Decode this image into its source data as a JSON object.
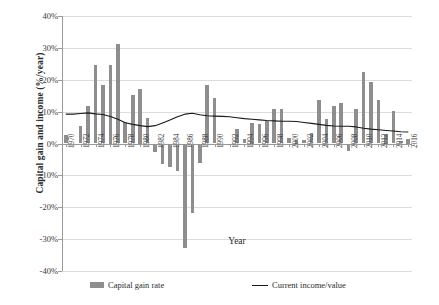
{
  "chart_data": {
    "type": "bar",
    "title": "",
    "xlabel": "Year",
    "ylabel": "Capital gain and income  (%/year)",
    "ylim": [
      -40,
      40
    ],
    "ytick_labels": [
      "40%",
      "30%",
      "20%",
      "10%",
      "0%",
      "-10%",
      "-20%",
      "-30%",
      "-40%"
    ],
    "ytick_values": [
      40,
      30,
      20,
      10,
      0,
      -10,
      -20,
      -30,
      -40
    ],
    "grid": true,
    "legend_position": "bottom",
    "categories": [
      "1970",
      "1971",
      "1972",
      "1973",
      "1974",
      "1975",
      "1976",
      "1977",
      "1978",
      "1979",
      "1980",
      "1981",
      "1982",
      "1983",
      "1984",
      "1985",
      "1986",
      "1987",
      "1988",
      "1989",
      "1990",
      "1991",
      "1992",
      "1993",
      "1994",
      "1995",
      "1996",
      "1997",
      "1998",
      "1999",
      "2000",
      "2001",
      "2002",
      "2003",
      "2004",
      "2005",
      "2006",
      "2007",
      "2008",
      "2009",
      "2010",
      "2011",
      "2012",
      "2013",
      "2014",
      "2015",
      "2016"
    ],
    "xtick_labels": [
      "1970",
      "",
      "1972",
      "",
      "1974",
      "",
      "1976",
      "",
      "1978",
      "",
      "1980",
      "",
      "1982",
      "",
      "1984",
      "",
      "1986",
      "",
      "1988",
      "",
      "1990",
      "",
      "1992",
      "",
      "1994",
      "",
      "1996",
      "",
      "1998",
      "",
      "2000",
      "",
      "2002",
      "",
      "2004",
      "",
      "2006",
      "",
      "2008",
      "",
      "2010",
      "",
      "2012",
      "",
      "2014",
      "",
      "2016"
    ],
    "series": [
      {
        "name": "Capital gain rate",
        "type": "bar",
        "color": "#8e8e8e",
        "values": [
          2.6,
          0.0,
          5.6,
          11.9,
          24.6,
          18.4,
          24.5,
          31.2,
          6.7,
          15.1,
          17.0,
          8.1,
          -2.8,
          -6.3,
          -7.4,
          -8.5,
          -32.8,
          -21.8,
          -6.0,
          18.3,
          14.2,
          0.0,
          -0.4,
          4.6,
          1.4,
          6.5,
          6.2,
          7.2,
          10.7,
          10.8,
          1.7,
          1.0,
          1.2,
          3.2,
          13.8,
          7.7,
          11.9,
          12.6,
          -2.2,
          10.9,
          22.4,
          19.2,
          13.7,
          3.0,
          10.2,
          0.8,
          1.5
        ]
      },
      {
        "name": "Current income/value",
        "type": "line",
        "color": "#1a1a1a",
        "values": [
          9.2,
          9.2,
          9.4,
          9.6,
          9.3,
          9.1,
          8.5,
          7.6,
          6.5,
          6.0,
          5.6,
          5.3,
          5.6,
          6.4,
          7.4,
          8.4,
          9.2,
          9.5,
          9.0,
          8.7,
          8.6,
          8.5,
          8.4,
          8.1,
          7.8,
          7.6,
          7.4,
          7.2,
          7.1,
          7.0,
          7.0,
          6.9,
          6.6,
          6.3,
          6.0,
          5.7,
          5.5,
          5.4,
          5.4,
          5.2,
          4.8,
          4.5,
          4.3,
          4.1,
          3.9,
          3.7,
          3.6
        ]
      }
    ]
  },
  "legend": {
    "items": [
      {
        "label": "Capital gain rate",
        "marker": "bar-swatch",
        "color": "#8e8e8e"
      },
      {
        "label": "Current income/value",
        "marker": "line-swatch",
        "color": "#1a1a1a"
      }
    ]
  }
}
